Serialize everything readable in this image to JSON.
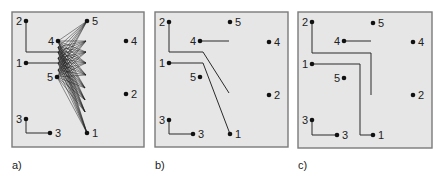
{
  "figure": {
    "style": {
      "panel_fill": "#e6e6e6",
      "panel_border": "#7a7a7a",
      "ink": "#111111"
    },
    "panels": [
      {
        "id": "a",
        "caption": "a)",
        "box": {
          "x": 12,
          "y": 12,
          "w": 132,
          "h": 135
        },
        "caption_pos": {
          "x": 12,
          "y": 169
        },
        "pins": [
          {
            "label": "2",
            "x": 26,
            "y": 21,
            "side": "left"
          },
          {
            "label": "5",
            "x": 87,
            "y": 21,
            "side": "right"
          },
          {
            "label": "4",
            "x": 58,
            "y": 41,
            "side": "left"
          },
          {
            "label": "4",
            "x": 126,
            "y": 41,
            "side": "right"
          },
          {
            "label": "1",
            "x": 26,
            "y": 63,
            "side": "left"
          },
          {
            "label": "5",
            "x": 57,
            "y": 77,
            "side": "left"
          },
          {
            "label": "2",
            "x": 126,
            "y": 94,
            "side": "right"
          },
          {
            "label": "3",
            "x": 26,
            "y": 119,
            "side": "left"
          },
          {
            "label": "3",
            "x": 50,
            "y": 133,
            "side": "right"
          },
          {
            "label": "1",
            "x": 87,
            "y": 133,
            "side": "right"
          }
        ],
        "wires": [
          [
            [
              26,
              21
            ],
            [
              26,
              52
            ],
            [
              58,
              52
            ]
          ],
          [
            [
              26,
              63
            ],
            [
              58,
              63
            ]
          ],
          [
            [
              26,
              119
            ],
            [
              26,
              133
            ],
            [
              50,
              133
            ]
          ]
        ],
        "mesh": {
          "left": [
            [
              58,
              41
            ],
            [
              58,
              47
            ],
            [
              58,
              52
            ],
            [
              58,
              58
            ],
            [
              58,
              63
            ],
            [
              58,
              70
            ],
            [
              57,
              77
            ]
          ],
          "right": [
            [
              87,
              21
            ],
            [
              86,
              41
            ],
            [
              86,
              52
            ],
            [
              86,
              63
            ],
            [
              86,
              75
            ],
            [
              85,
              88
            ],
            [
              85,
              100
            ],
            [
              85,
              112
            ],
            [
              87,
              133
            ]
          ]
        }
      },
      {
        "id": "b",
        "caption": "b)",
        "box": {
          "x": 155,
          "y": 12,
          "w": 133,
          "h": 135
        },
        "caption_pos": {
          "x": 155,
          "y": 169
        },
        "pins": [
          {
            "label": "2",
            "x": 169,
            "y": 22,
            "side": "left"
          },
          {
            "label": "5",
            "x": 230,
            "y": 22,
            "side": "right"
          },
          {
            "label": "4",
            "x": 200,
            "y": 41,
            "side": "left"
          },
          {
            "label": "4",
            "x": 269,
            "y": 42,
            "side": "right"
          },
          {
            "label": "1",
            "x": 169,
            "y": 63,
            "side": "left"
          },
          {
            "label": "5",
            "x": 200,
            "y": 77,
            "side": "left"
          },
          {
            "label": "2",
            "x": 269,
            "y": 95,
            "side": "right"
          },
          {
            "label": "3",
            "x": 169,
            "y": 120,
            "side": "left"
          },
          {
            "label": "3",
            "x": 193,
            "y": 134,
            "side": "right"
          },
          {
            "label": "1",
            "x": 230,
            "y": 134,
            "side": "right"
          }
        ],
        "wires": [
          [
            [
              169,
              22
            ],
            [
              169,
              52
            ],
            [
              203,
              52
            ],
            [
              229,
              93
            ]
          ],
          [
            [
              200,
              41
            ],
            [
              229,
              41
            ]
          ],
          [
            [
              169,
              63
            ],
            [
              203,
              63
            ],
            [
              230,
              134
            ]
          ],
          [
            [
              169,
              120
            ],
            [
              169,
              134
            ],
            [
              193,
              134
            ]
          ]
        ]
      },
      {
        "id": "c",
        "caption": "c)",
        "box": {
          "x": 298,
          "y": 12,
          "w": 134,
          "h": 136
        },
        "caption_pos": {
          "x": 298,
          "y": 169
        },
        "pins": [
          {
            "label": "2",
            "x": 312,
            "y": 22,
            "side": "left"
          },
          {
            "label": "5",
            "x": 373,
            "y": 23,
            "side": "right"
          },
          {
            "label": "4",
            "x": 344,
            "y": 41,
            "side": "left"
          },
          {
            "label": "4",
            "x": 413,
            "y": 42,
            "side": "right"
          },
          {
            "label": "1",
            "x": 312,
            "y": 64,
            "side": "left"
          },
          {
            "label": "5",
            "x": 344,
            "y": 78,
            "side": "left"
          },
          {
            "label": "2",
            "x": 413,
            "y": 95,
            "side": "right"
          },
          {
            "label": "3",
            "x": 312,
            "y": 120,
            "side": "left"
          },
          {
            "label": "3",
            "x": 337,
            "y": 135,
            "side": "right"
          },
          {
            "label": "1",
            "x": 373,
            "y": 135,
            "side": "right"
          }
        ],
        "wires": [
          [
            [
              312,
              22
            ],
            [
              312,
              53
            ],
            [
              371,
              53
            ],
            [
              371,
              95
            ]
          ],
          [
            [
              344,
              41
            ],
            [
              371,
              41
            ]
          ],
          [
            [
              312,
              64
            ],
            [
              360,
              64
            ],
            [
              360,
              135
            ],
            [
              373,
              135
            ]
          ],
          [
            [
              312,
              120
            ],
            [
              312,
              135
            ],
            [
              337,
              135
            ]
          ]
        ]
      }
    ]
  }
}
